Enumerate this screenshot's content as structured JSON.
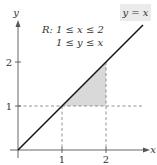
{
  "diagram": {
    "axes": {
      "x_label": "x",
      "y_label": "y",
      "x_ticks": [
        "1",
        "2"
      ],
      "y_ticks": [
        "1",
        "2"
      ]
    },
    "line_label": "y = x",
    "region": {
      "name": "R:",
      "constraint_1": "1 ≤ x ≤ 2",
      "constraint_2": "1 ≤ y ≤ x"
    },
    "colors": {
      "axis": "#555555",
      "line": "#1a1a1a",
      "shade": "#d9d9d9",
      "dash": "#777777",
      "label_box": "#ebebeb"
    }
  }
}
